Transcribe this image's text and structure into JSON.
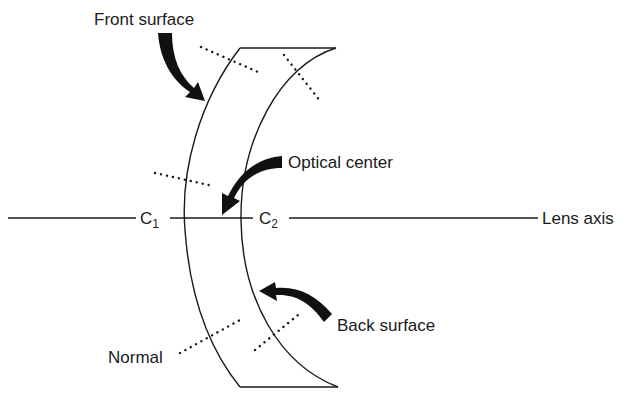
{
  "diagram": {
    "labels": {
      "front_surface": "Front surface",
      "optical_center": "Optical center",
      "lens_axis": "Lens axis",
      "back_surface": "Back surface",
      "normal": "Normal",
      "c1_main": "C",
      "c1_sub": "1",
      "c2_main": "C",
      "c2_sub": "2"
    },
    "colors": {
      "ink": "#1a1a1a",
      "background": "#ffffff"
    }
  }
}
